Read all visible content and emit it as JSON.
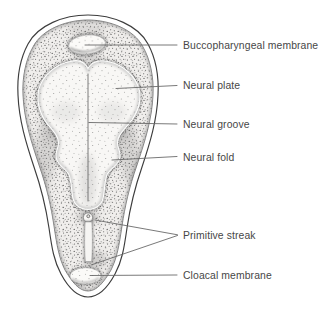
{
  "figure": {
    "kind": "embryology-line-illustration",
    "structures": [
      "embryonic-disc",
      "buccopharyngeal-membrane",
      "neural-plate",
      "neural-groove",
      "neural-fold",
      "primitive-node",
      "primitive-streak",
      "cloacal-membrane"
    ],
    "colors": {
      "background": "#ffffff",
      "outline": "#3d3d3d",
      "stipple": "#4d4d4d",
      "leader_line": "#6a6a6a",
      "label_text": "#474747"
    }
  },
  "labels": [
    {
      "id": "buccopharyngeal-membrane",
      "text": "Buccopharyngeal membrane"
    },
    {
      "id": "neural-plate",
      "text": "Neural plate"
    },
    {
      "id": "neural-groove",
      "text": "Neural groove"
    },
    {
      "id": "neural-fold",
      "text": "Neural fold"
    },
    {
      "id": "primitive-streak",
      "text": "Primitive streak"
    },
    {
      "id": "cloacal-membrane",
      "text": "Cloacal membrane"
    }
  ]
}
